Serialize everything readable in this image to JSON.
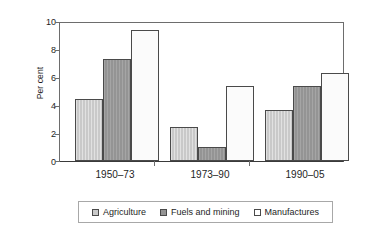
{
  "chart_data": {
    "type": "bar",
    "title": "",
    "subtitle": "",
    "xlabel": "",
    "ylabel": "Per cent",
    "ylim": [
      0,
      10
    ],
    "yticks": [
      0,
      2,
      4,
      6,
      8,
      10
    ],
    "ytick_labels": [
      "0",
      "2",
      "4",
      "6",
      "8",
      "10"
    ],
    "grid": false,
    "legend_position": "bottom",
    "categories": [
      "1950–73",
      "1973–90",
      "1990–05"
    ],
    "series": [
      {
        "name": "Agriculture",
        "color": "#c9c9c9",
        "values": [
          4.5,
          2.5,
          3.7
        ]
      },
      {
        "name": "Fuels and mining",
        "color": "#949494",
        "values": [
          7.4,
          1.0,
          5.4
        ]
      },
      {
        "name": "Manufactures",
        "color": "#ffffff",
        "values": [
          9.5,
          5.45,
          6.4
        ]
      }
    ],
    "annotations": []
  },
  "legend": {
    "entries": [
      {
        "label": "Agriculture"
      },
      {
        "label": "Fuels and mining"
      },
      {
        "label": "Manufactures"
      }
    ]
  },
  "axes": {
    "y_label": "Per cent",
    "y_tick_labels": [
      "10",
      "8",
      "6",
      "4",
      "2",
      "0"
    ],
    "x_tick_labels": [
      "1950–73",
      "1973–90",
      "1990–05"
    ]
  }
}
